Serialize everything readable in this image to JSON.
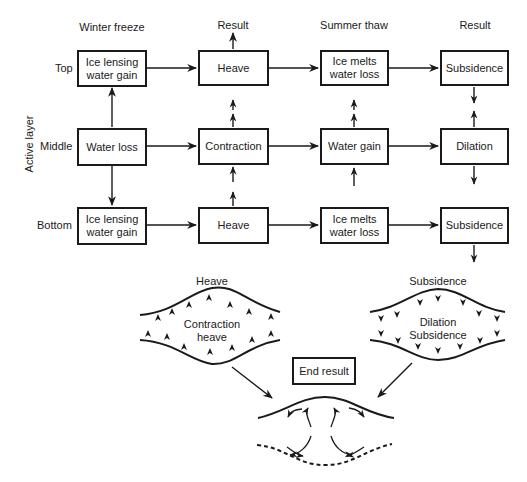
{
  "diagram": {
    "axis_label": "Active layer",
    "column_headers": [
      "Winter freeze",
      "Result",
      "Summer thaw",
      "Result"
    ],
    "row_labels": [
      "Top",
      "Middle",
      "Bottom"
    ],
    "grid": {
      "top": [
        "Ice lensing\nwater gain",
        "Heave",
        "Ice melts\nwater loss",
        "Subsidence"
      ],
      "middle": [
        "Water loss",
        "Contraction",
        "Water gain",
        "Dilation"
      ],
      "bottom": [
        "Ice lensing\nwater gain",
        "Heave",
        "Ice melts\nwater loss",
        "Subsidence"
      ]
    },
    "lower": {
      "left_lens": {
        "title": "Heave",
        "inner": "Contraction\nheave",
        "arrow_direction": "up"
      },
      "right_lens": {
        "title": "Subsidence",
        "inner": "Dilation\nSubsidence",
        "arrow_direction": "down"
      },
      "end_result_label": "End result"
    }
  }
}
